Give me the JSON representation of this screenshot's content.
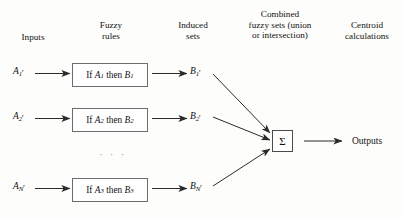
{
  "headers": {
    "inputs": "Inputs",
    "fuzzy_rules": "Fuzzy\nrules",
    "induced_sets": "Induced\nsets",
    "combined": "Combined\nfuzzy sets (union\nor intersection)",
    "centroid": "Centroid\ncalculations"
  },
  "inputs": [
    {
      "base": "A",
      "sub": "1",
      "prime": "′"
    },
    {
      "base": "A",
      "sub": "2",
      "prime": "′"
    },
    {
      "base": "A",
      "sub": "N",
      "prime": "′"
    }
  ],
  "rules": [
    {
      "if_text": "If",
      "var_a": "A",
      "sub_a": "1",
      "then_text": "then",
      "var_b": "B",
      "sub_b": "1"
    },
    {
      "if_text": "If",
      "var_a": "A",
      "sub_a": "2",
      "then_text": "then",
      "var_b": "B",
      "sub_b": "2"
    },
    {
      "if_text": "If",
      "var_a": "A",
      "sub_a": "3",
      "then_text": "then",
      "var_b": "B",
      "sub_b": "3"
    }
  ],
  "induced": [
    {
      "base": "B",
      "sub": "1",
      "prime": "′"
    },
    {
      "base": "B",
      "sub": "2",
      "prime": "′"
    },
    {
      "base": "B",
      "sub": "N",
      "prime": "′"
    }
  ],
  "combiner": {
    "symbol": "Σ"
  },
  "vertical_ellipsis": "· · ·",
  "outputs": {
    "label": "Outputs"
  },
  "colors": {
    "background": "#fdfdfb",
    "text": "#111111",
    "box_border": "#6d6d6d",
    "sigma_border": "#4a4a4a",
    "arrow": "#2b2b2b",
    "ellipsis": "#9a9a9a"
  }
}
